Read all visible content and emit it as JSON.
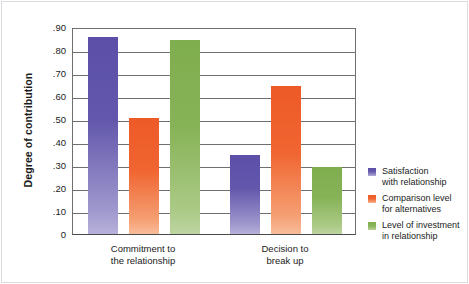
{
  "chart_data": {
    "type": "bar",
    "title": "",
    "subtitle": "",
    "xlabel": "",
    "ylabel": "Degree of contribution",
    "ylim": [
      0,
      0.9
    ],
    "ytick_labels": [
      ".90",
      ".80",
      ".70",
      ".60",
      ".50",
      ".40",
      ".30",
      ".20",
      ".10",
      "0"
    ],
    "ytick_values": [
      0.9,
      0.8,
      0.7,
      0.6,
      0.5,
      0.4,
      0.3,
      0.2,
      0.1,
      0
    ],
    "grid": "horizontal",
    "legend_position": "right",
    "categories": [
      "Commitment to the relationship",
      "Decision to break up"
    ],
    "category_lines": [
      [
        "Commitment to",
        "the relationship"
      ],
      [
        "Decision to",
        "break up"
      ]
    ],
    "series": [
      {
        "name": "Satisfaction with relationship",
        "name_lines": [
          "Satisfaction",
          "with relationship"
        ],
        "color": "#5B4FA8",
        "values": [
          0.855,
          0.345
        ]
      },
      {
        "name": "Comparison level for alternatives",
        "name_lines": [
          "Comparison level",
          "for alternatives"
        ],
        "color": "#ED5A28",
        "values": [
          0.505,
          0.645
        ]
      },
      {
        "name": "Level of investment in relationship",
        "name_lines": [
          "Level of investment",
          "in relationship"
        ],
        "color": "#7FAE4E",
        "values": [
          0.845,
          0.29
        ]
      }
    ]
  }
}
